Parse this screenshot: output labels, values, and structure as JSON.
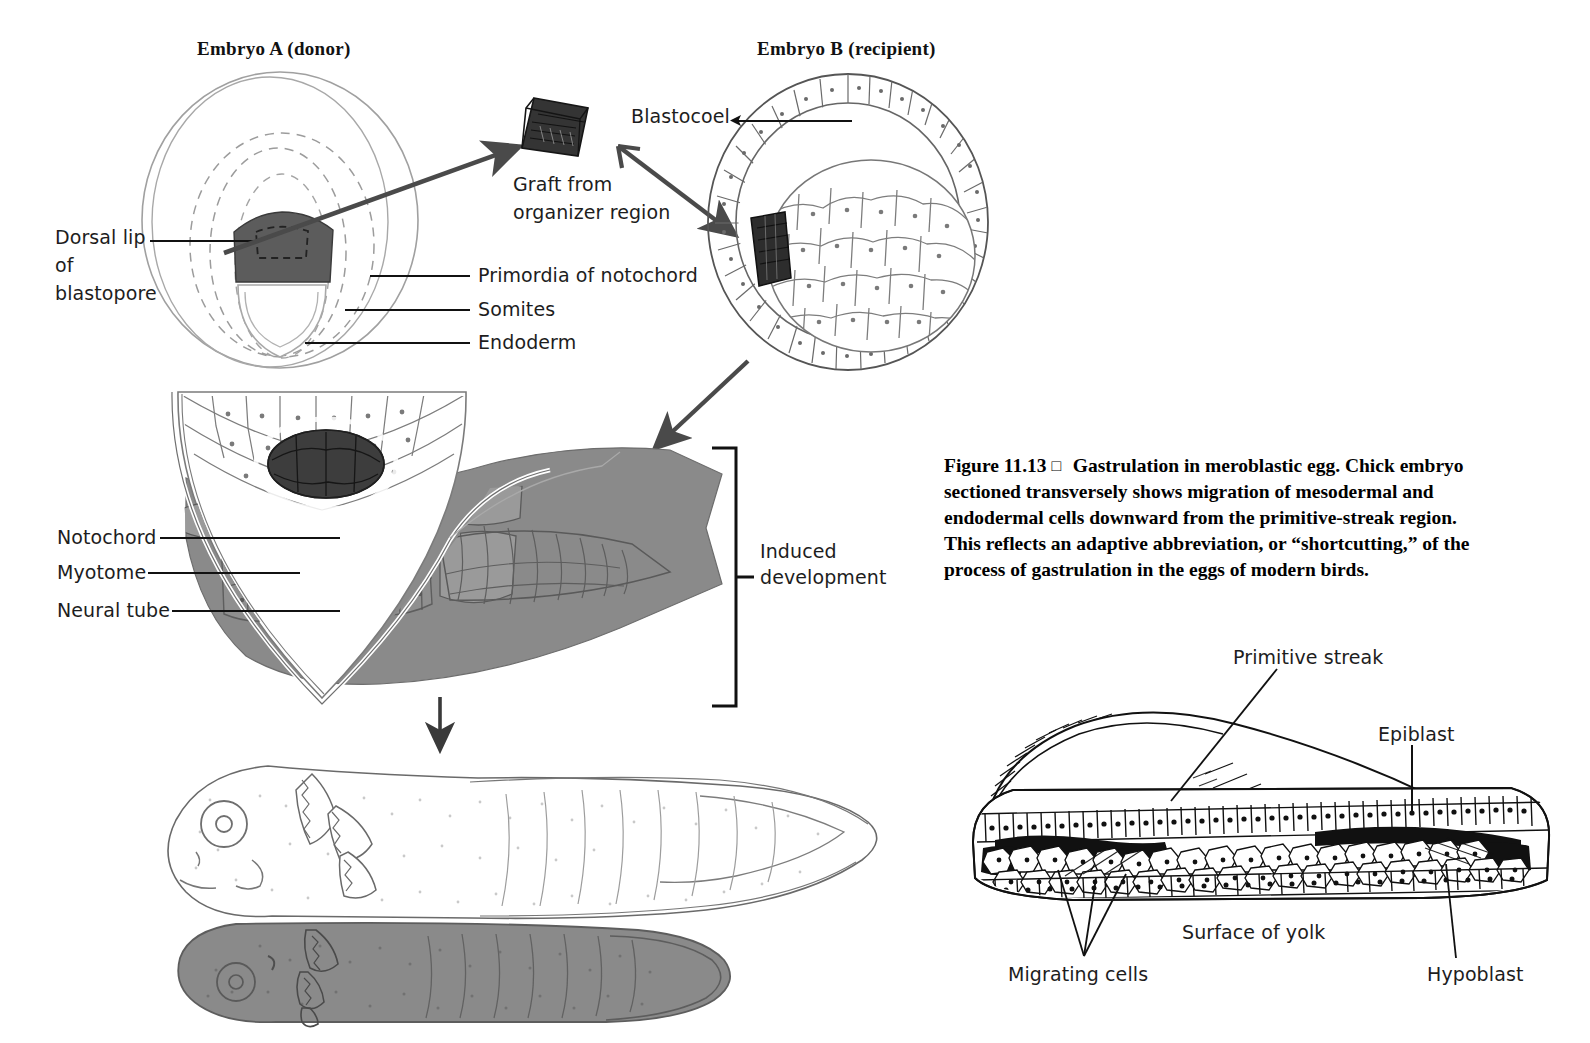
{
  "figure": {
    "headers": {
      "embryo_a": "Embryo A (donor)",
      "embryo_b": "Embryo B (recipient)"
    },
    "labels": {
      "dorsal_lip_l1": "Dorsal lip",
      "dorsal_lip_l2": "of",
      "dorsal_lip_l3": "blastopore",
      "graft_l1": "Graft from",
      "graft_l2": "organizer region",
      "primordia": "Primordia of notochord",
      "somites": "Somites",
      "endoderm": "Endoderm",
      "blastocoel": "Blastocoel",
      "notochord": "Notochord",
      "myotome": "Myotome",
      "neural_tube": "Neural tube",
      "induced_l1": "Induced",
      "induced_l2": "development",
      "primitive_streak": "Primitive streak",
      "epiblast": "Epiblast",
      "hypoblast": "Hypoblast",
      "surface_of_yolk": "Surface of yolk",
      "migrating_cells": "Migrating cells"
    },
    "caption": {
      "number": "Figure 11.13",
      "marker": "□",
      "text": "Gastrulation in meroblastic egg. Chick embryo sectioned transversely shows migration of mesodermal and endodermal cells downward from the primitive-streak region. This reflects an adaptive abbreviation, or “shortcutting,” of the process of gastrulation in the eggs of modern birds."
    },
    "colors": {
      "ink": "#1a1a1a",
      "graft_dark": "#2d2d2d",
      "dorsal_lip_gray": "#5c5c5c",
      "tissue_gray": "#8a8a8a",
      "outline_gray": "#9a9a9a",
      "arrow_gray": "#4a4a4a",
      "paper": "#ffffff"
    },
    "icons": {
      "transplant_arrow": "arrow-right-icon",
      "insertion_arrow": "arrow-down-right-icon",
      "result_arrow": "arrow-down-icon",
      "bracket": "bracket-icon",
      "caption_marker": "square-marker-icon"
    }
  }
}
